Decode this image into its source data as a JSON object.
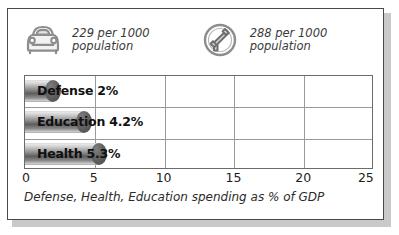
{
  "stats": [
    {
      "icon": "car-icon",
      "value_line1": "229 per 1000",
      "value_line2": "population"
    },
    {
      "icon": "telephone-icon",
      "value_line1": "288 per 1000",
      "value_line2": "population"
    }
  ],
  "chart_data": {
    "type": "bar",
    "orientation": "horizontal",
    "title": "",
    "caption": "Defense, Health, Education spending as % of GDP",
    "categories": [
      "Defense",
      "Education",
      "Health"
    ],
    "values": [
      2,
      4.2,
      5.3
    ],
    "value_labels": [
      "2%",
      "4.2%",
      "5.3%"
    ],
    "bar_labels": [
      "Defense 2%",
      "Education 4.2%",
      "Health 5.3%"
    ],
    "xlabel": "",
    "ylabel": "",
    "xlim": [
      0,
      25
    ],
    "xticks": [
      0,
      5,
      10,
      15,
      20,
      25
    ],
    "xtick_labels": [
      "0",
      "5",
      "10",
      "15",
      "20",
      "25"
    ],
    "grid": true,
    "gridlines_x": [
      5,
      10,
      15,
      20
    ],
    "legend": "none",
    "colors": {
      "bar_dark": "#5d5d5d",
      "bar_light": "#e9e9e9",
      "grid": "#9a9a9a",
      "axis": "#6b6b6b",
      "frame": "#4a4a4a",
      "text": "#111111"
    }
  }
}
